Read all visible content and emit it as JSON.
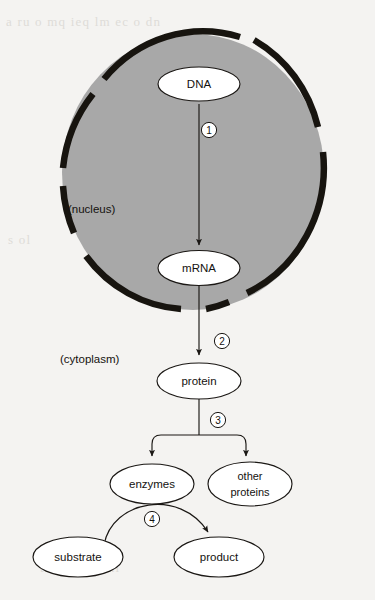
{
  "diagram": {
    "background_color": "#f4f3f1",
    "nucleus_fill": "#a8a8a8",
    "membrane_color": "#17140f",
    "line_color": "#1a1714",
    "regions": [
      {
        "id": "nucleus",
        "label": "(nucleus)"
      },
      {
        "id": "cytoplasm",
        "label": "(cytoplasm)"
      }
    ],
    "nodes": [
      {
        "id": "dna",
        "label": "DNA"
      },
      {
        "id": "mrna",
        "label": "mRNA"
      },
      {
        "id": "protein",
        "label": "protein"
      },
      {
        "id": "enzymes",
        "label": "enzymes"
      },
      {
        "id": "other_proteins",
        "label_line1": "other",
        "label_line2": "proteins"
      },
      {
        "id": "substrate",
        "label": "substrate"
      },
      {
        "id": "product",
        "label": "product"
      }
    ],
    "steps": [
      {
        "id": "step-1",
        "number": "1",
        "from": "dna",
        "to": "mrna"
      },
      {
        "id": "step-2",
        "number": "2",
        "from": "mrna",
        "to": "protein"
      },
      {
        "id": "step-3",
        "number": "3",
        "from": "protein",
        "to": "enzymes / other proteins"
      },
      {
        "id": "step-4",
        "number": "4",
        "from": "substrate",
        "to": "product"
      }
    ]
  },
  "scan_artifacts": {
    "top_bleed": "a ru o mq ieq lm ec o dn",
    "mid_bleed": "s ol",
    "bottom_bleed": "tn re ar lg ni"
  }
}
